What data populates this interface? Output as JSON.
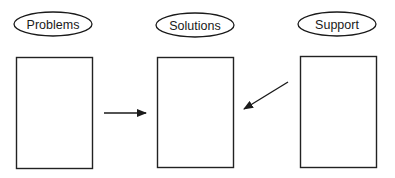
{
  "diagram": {
    "nodes": [
      {
        "id": "problems",
        "label": "Problems"
      },
      {
        "id": "solutions",
        "label": "Solutions"
      },
      {
        "id": "support",
        "label": "Support"
      }
    ],
    "edges": [
      {
        "from": "problems",
        "to": "solutions"
      },
      {
        "from": "support",
        "to": "solutions"
      }
    ],
    "colors": {
      "stroke": "#1a1a1a",
      "background": "#ffffff"
    }
  }
}
